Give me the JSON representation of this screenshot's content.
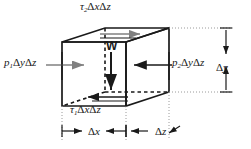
{
  "figure": {
    "type": "free-body-diagram",
    "colors": {
      "line": "#1a1a1a",
      "arrow_gray": "#808080",
      "background": "#ffffff",
      "dotted": "#9a9a9a"
    },
    "labels": {
      "tau_top": {
        "symbol": "τ",
        "subscript": "2",
        "expression": "ΔxΔz",
        "full": "τ2ΔxΔz"
      },
      "tau_bottom": {
        "symbol": "τ",
        "subscript": "1",
        "expression": "ΔxΔz",
        "full": "τ1ΔxΔz"
      },
      "p_left": {
        "symbol": "p",
        "subscript": "1",
        "expression": "ΔyΔz",
        "full": "p1ΔyΔz"
      },
      "p_right": {
        "symbol": "p",
        "subscript": "2",
        "expression": "ΔyΔz",
        "full": "p2ΔyΔz"
      },
      "weight": {
        "symbol": "W",
        "full": "W"
      },
      "dim_height": {
        "full": "Δy"
      },
      "dim_width": {
        "full": "Δx"
      },
      "dim_depth": {
        "full": "Δz"
      }
    }
  }
}
